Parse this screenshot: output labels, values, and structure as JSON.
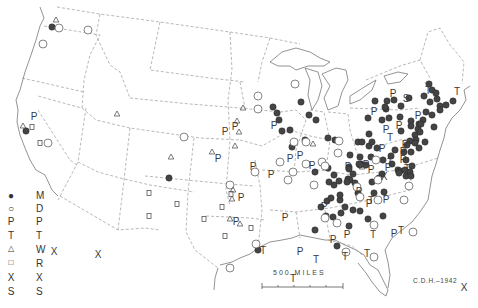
{
  "legend": {
    "items": [
      {
        "symbol": "filled-circle",
        "glyph": "●",
        "code": "M"
      },
      {
        "symbol": "open-circle",
        "glyph": "○",
        "code": "D"
      },
      {
        "symbol": "letter-P",
        "glyph": "P",
        "code": "P"
      },
      {
        "symbol": "letter-T",
        "glyph": "T",
        "code": "T"
      },
      {
        "symbol": "triangle",
        "glyph": "△",
        "code": "W"
      },
      {
        "symbol": "square",
        "glyph": "□",
        "code": "R"
      },
      {
        "symbol": "letter-X",
        "glyph": "X",
        "code": "X"
      },
      {
        "symbol": "letter-S",
        "glyph": "S",
        "code": "S"
      }
    ]
  },
  "scale_bar": {
    "label": "500 MILES"
  },
  "credit": "C.D.H.–1942",
  "colors": {
    "ink": "#3a3a3a",
    "border": "#9a9a9a",
    "filled": "#444444"
  },
  "markers": {
    "filled": [
      [
        52,
        27
      ],
      [
        26,
        131
      ],
      [
        169,
        178
      ],
      [
        273,
        107
      ],
      [
        277,
        113
      ],
      [
        279,
        120
      ],
      [
        282,
        131
      ],
      [
        301,
        102
      ],
      [
        290,
        130
      ],
      [
        292,
        147
      ],
      [
        305,
        140
      ],
      [
        322,
        163
      ],
      [
        328,
        168
      ],
      [
        315,
        172
      ],
      [
        329,
        182
      ],
      [
        334,
        175
      ],
      [
        334,
        185
      ],
      [
        339,
        181
      ],
      [
        321,
        207
      ],
      [
        327,
        201
      ],
      [
        340,
        200
      ],
      [
        345,
        207
      ],
      [
        341,
        213
      ],
      [
        333,
        217
      ],
      [
        315,
        230
      ],
      [
        337,
        246
      ],
      [
        340,
        195
      ],
      [
        349,
        167
      ],
      [
        348,
        179
      ],
      [
        361,
        164
      ],
      [
        371,
        157
      ],
      [
        382,
        174
      ],
      [
        395,
        150
      ],
      [
        374,
        193
      ],
      [
        384,
        192
      ],
      [
        360,
        211
      ],
      [
        368,
        219
      ],
      [
        383,
        216
      ],
      [
        398,
        170
      ],
      [
        412,
        166
      ],
      [
        406,
        176
      ],
      [
        429,
        84
      ],
      [
        432,
        90
      ],
      [
        436,
        93
      ],
      [
        424,
        96
      ],
      [
        437,
        99
      ],
      [
        440,
        106
      ],
      [
        430,
        102
      ],
      [
        426,
        112
      ],
      [
        423,
        120
      ],
      [
        418,
        129
      ],
      [
        432,
        115
      ],
      [
        440,
        110
      ],
      [
        446,
        105
      ],
      [
        453,
        101
      ],
      [
        415,
        135
      ],
      [
        401,
        131
      ],
      [
        410,
        141
      ],
      [
        407,
        145
      ],
      [
        404,
        152
      ],
      [
        411,
        152
      ],
      [
        419,
        148
      ],
      [
        425,
        142
      ],
      [
        419,
        124
      ],
      [
        411,
        121
      ],
      [
        400,
        117
      ],
      [
        389,
        118
      ],
      [
        386,
        109
      ],
      [
        387,
        101
      ],
      [
        394,
        100
      ],
      [
        409,
        98
      ],
      [
        401,
        106
      ],
      [
        375,
        101
      ],
      [
        368,
        118
      ],
      [
        382,
        120
      ],
      [
        358,
        193
      ],
      [
        350,
        180
      ],
      [
        400,
        171
      ],
      [
        360,
        165
      ],
      [
        369,
        146
      ],
      [
        359,
        164
      ],
      [
        377,
        148
      ],
      [
        392,
        164
      ],
      [
        369,
        134
      ],
      [
        358,
        142
      ],
      [
        355,
        183
      ],
      [
        372,
        182
      ],
      [
        353,
        210
      ],
      [
        347,
        182
      ],
      [
        410,
        172
      ],
      [
        349,
        226
      ],
      [
        379,
        178
      ],
      [
        350,
        155
      ],
      [
        335,
        140
      ],
      [
        328,
        138
      ],
      [
        316,
        120
      ],
      [
        385,
        107
      ],
      [
        405,
        170
      ],
      [
        326,
        216
      ],
      [
        421,
        124
      ],
      [
        434,
        127
      ],
      [
        416,
        140
      ],
      [
        415,
        143
      ],
      [
        372,
        142
      ],
      [
        406,
        160
      ],
      [
        411,
        176
      ],
      [
        420,
        132
      ],
      [
        360,
        157
      ],
      [
        411,
        126
      ],
      [
        399,
        173
      ],
      [
        309,
        115
      ],
      [
        258,
        250
      ],
      [
        391,
        156
      ],
      [
        331,
        198
      ],
      [
        349,
        169
      ],
      [
        353,
        174
      ],
      [
        362,
        142
      ],
      [
        383,
        160
      ],
      [
        366,
        165
      ]
    ],
    "open": [
      [
        59,
        28
      ],
      [
        43,
        44
      ],
      [
        88,
        30
      ],
      [
        48,
        143
      ],
      [
        184,
        137
      ],
      [
        258,
        96
      ],
      [
        295,
        84
      ],
      [
        258,
        109
      ],
      [
        294,
        142
      ],
      [
        306,
        142
      ],
      [
        306,
        164
      ],
      [
        293,
        172
      ],
      [
        280,
        162
      ],
      [
        288,
        180
      ],
      [
        255,
        172
      ],
      [
        230,
        185
      ],
      [
        230,
        268
      ],
      [
        256,
        244
      ],
      [
        322,
        162
      ],
      [
        339,
        141
      ],
      [
        338,
        153
      ],
      [
        325,
        166
      ],
      [
        314,
        185
      ],
      [
        325,
        218
      ],
      [
        337,
        223
      ],
      [
        357,
        187
      ],
      [
        360,
        197
      ],
      [
        376,
        160
      ],
      [
        378,
        180
      ],
      [
        409,
        186
      ],
      [
        413,
        232
      ],
      [
        346,
        252
      ],
      [
        374,
        225
      ],
      [
        374,
        257
      ],
      [
        378,
        200
      ],
      [
        404,
        200
      ]
    ],
    "P": [
      [
        34,
        116
      ],
      [
        235,
        126
      ],
      [
        225,
        131
      ],
      [
        274,
        125
      ],
      [
        290,
        158
      ],
      [
        300,
        155
      ],
      [
        271,
        174
      ],
      [
        253,
        166
      ],
      [
        218,
        158
      ],
      [
        241,
        197
      ],
      [
        324,
        206
      ],
      [
        359,
        191
      ],
      [
        285,
        217
      ],
      [
        236,
        221
      ],
      [
        369,
        203
      ],
      [
        347,
        234
      ],
      [
        333,
        239
      ],
      [
        300,
        251
      ],
      [
        394,
        233
      ],
      [
        418,
        115
      ],
      [
        393,
        93
      ],
      [
        312,
        165
      ],
      [
        399,
        125
      ],
      [
        403,
        151
      ],
      [
        386,
        129
      ],
      [
        366,
        164
      ],
      [
        388,
        167
      ],
      [
        374,
        111
      ],
      [
        405,
        144
      ],
      [
        371,
        169
      ],
      [
        348,
        166
      ],
      [
        382,
        148
      ],
      [
        386,
        199
      ],
      [
        403,
        159
      ]
    ],
    "T": [
      [
        390,
        137
      ],
      [
        407,
        168
      ],
      [
        390,
        162
      ],
      [
        371,
        200
      ],
      [
        316,
        259
      ],
      [
        345,
        256
      ],
      [
        401,
        230
      ],
      [
        373,
        234
      ],
      [
        457,
        91
      ],
      [
        428,
        90
      ],
      [
        367,
        253
      ],
      [
        293,
        278
      ],
      [
        263,
        250
      ]
    ],
    "triangle": [
      [
        56,
        20
      ],
      [
        23,
        126
      ],
      [
        117,
        114
      ],
      [
        171,
        157
      ],
      [
        243,
        108
      ],
      [
        237,
        121
      ],
      [
        239,
        132
      ],
      [
        235,
        146
      ],
      [
        313,
        144
      ],
      [
        212,
        152
      ],
      [
        233,
        190
      ],
      [
        232,
        199
      ],
      [
        230,
        219
      ],
      [
        240,
        224
      ],
      [
        362,
        167
      ]
    ],
    "square": [
      [
        32,
        127
      ],
      [
        40,
        143
      ],
      [
        149,
        193
      ],
      [
        149,
        216
      ],
      [
        177,
        204
      ],
      [
        204,
        219
      ],
      [
        231,
        194
      ],
      [
        222,
        207
      ],
      [
        225,
        236
      ],
      [
        251,
        228
      ]
    ],
    "X": [
      [
        54,
        251
      ],
      [
        98,
        254
      ],
      [
        384,
        176
      ],
      [
        464,
        287
      ]
    ],
    "S": [
      [
        406,
        98
      ]
    ]
  }
}
